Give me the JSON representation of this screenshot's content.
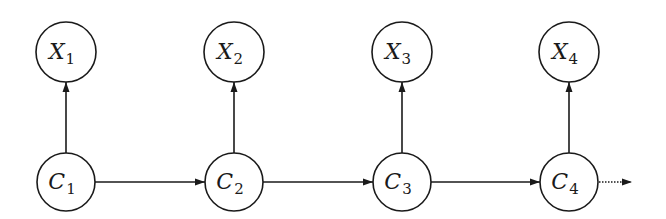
{
  "diagram": {
    "type": "graphical-model",
    "nodes": [
      {
        "id": "X1",
        "letter": "X",
        "subscript": "1",
        "row": "observed",
        "column": 0
      },
      {
        "id": "X2",
        "letter": "X",
        "subscript": "2",
        "row": "observed",
        "column": 1
      },
      {
        "id": "X3",
        "letter": "X",
        "subscript": "3",
        "row": "observed",
        "column": 2
      },
      {
        "id": "X4",
        "letter": "X",
        "subscript": "4",
        "row": "observed",
        "column": 3
      },
      {
        "id": "C1",
        "letter": "C",
        "subscript": "1",
        "row": "hidden",
        "column": 0
      },
      {
        "id": "C2",
        "letter": "C",
        "subscript": "2",
        "row": "hidden",
        "column": 1
      },
      {
        "id": "C3",
        "letter": "C",
        "subscript": "3",
        "row": "hidden",
        "column": 2
      },
      {
        "id": "C4",
        "letter": "C",
        "subscript": "4",
        "row": "hidden",
        "column": 3
      }
    ],
    "edges": [
      {
        "from": "C1",
        "to": "X1",
        "style": "solid"
      },
      {
        "from": "C2",
        "to": "X2",
        "style": "solid"
      },
      {
        "from": "C3",
        "to": "X3",
        "style": "solid"
      },
      {
        "from": "C4",
        "to": "X4",
        "style": "solid"
      },
      {
        "from": "C1",
        "to": "C2",
        "style": "solid"
      },
      {
        "from": "C2",
        "to": "C3",
        "style": "solid"
      },
      {
        "from": "C3",
        "to": "C4",
        "style": "solid"
      },
      {
        "from": "C4",
        "to": "continuation",
        "style": "dotted"
      }
    ],
    "colors": {
      "stroke": "#1a1a1a",
      "fill": "#ffffff",
      "background": "#ffffff"
    }
  }
}
